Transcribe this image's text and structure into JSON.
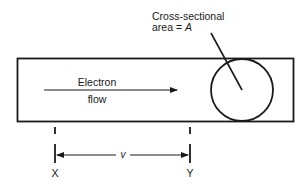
{
  "diagram": {
    "callout": {
      "line1": "Cross-sectional",
      "line2_prefix": "area = ",
      "line2_var": "A"
    },
    "flow_label": {
      "line1": "Electron",
      "line2": "flow"
    },
    "distance_label": "v",
    "points": {
      "left": "X",
      "right": "Y"
    },
    "colors": {
      "stroke": "#1a1a1a",
      "background": "#ffffff"
    }
  }
}
